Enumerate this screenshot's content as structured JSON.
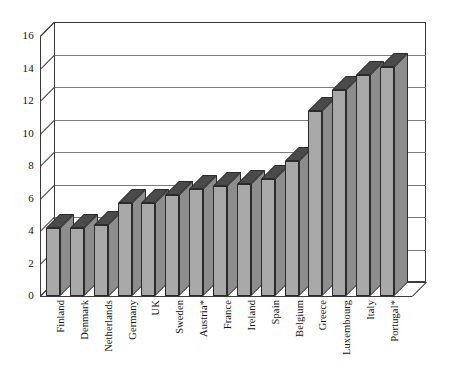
{
  "chart_data": {
    "type": "bar",
    "title": "",
    "subtitle": "",
    "xlabel": "",
    "ylabel": "",
    "ylim": [
      0,
      16
    ],
    "ytick_step": 2,
    "yticks": [
      0,
      2,
      4,
      6,
      8,
      10,
      12,
      14,
      16
    ],
    "grid": true,
    "legend": false,
    "legend_position": "none",
    "style": "3d-column",
    "categories": [
      "Finland",
      "Denmark",
      "Netherlands",
      "Germany",
      "UK",
      "Sweden",
      "Austria*",
      "France",
      "Ireland",
      "Spain",
      "Belgium",
      "Greece",
      "Luxembourg",
      "Italy",
      "Portugal*"
    ],
    "values": [
      4.2,
      4.2,
      4.4,
      5.7,
      5.7,
      6.2,
      6.6,
      6.8,
      6.9,
      7.2,
      8.3,
      11.4,
      12.7,
      13.6,
      14.1
    ],
    "series": [
      {
        "name": "",
        "values": [
          4.2,
          4.2,
          4.4,
          5.7,
          5.7,
          6.2,
          6.6,
          6.8,
          6.9,
          7.2,
          8.3,
          11.4,
          12.7,
          13.6,
          14.1
        ]
      }
    ],
    "annotations": [
      "*"
    ],
    "colors": {
      "bar_face": "#a8a8a8",
      "bar_top": "#4a4a4a",
      "bar_side": "#8d8d8d",
      "bar_outline": "#2b2b2b",
      "gridline": "#7a7a7a",
      "axis": "#3b3b3b",
      "background": "#ffffff",
      "text": "#111111"
    }
  }
}
